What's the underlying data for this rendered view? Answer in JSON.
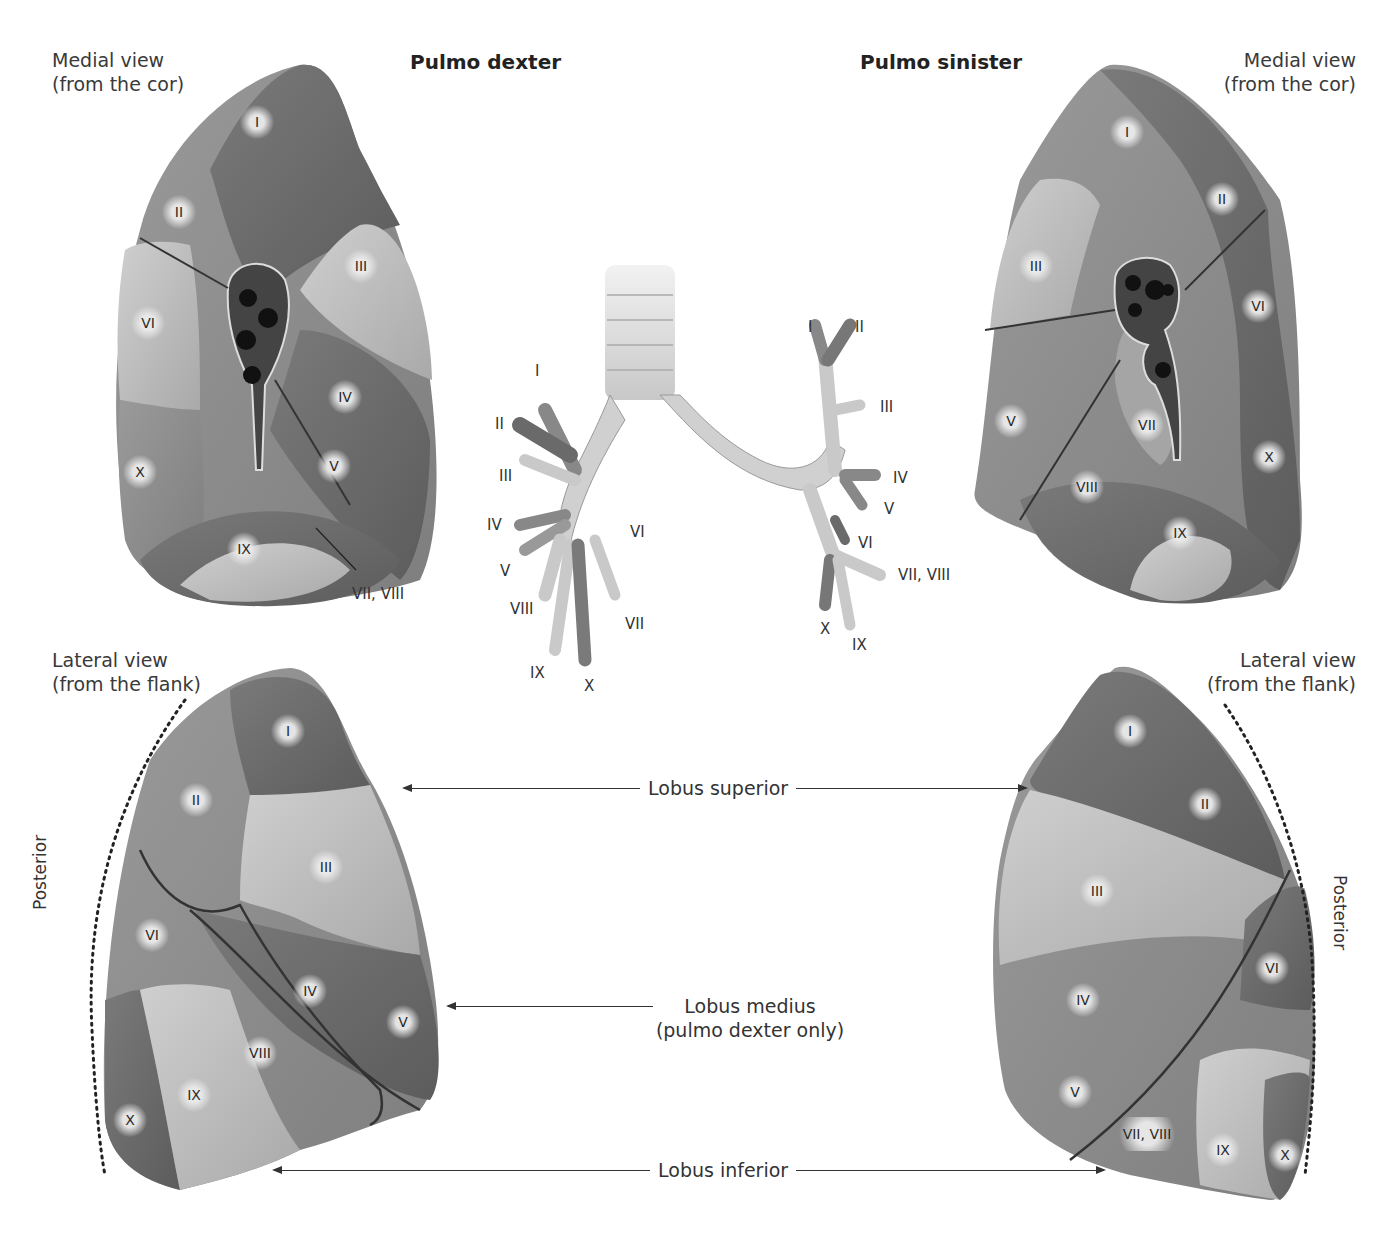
{
  "titles": {
    "right_lung": "Pulmo dexter",
    "left_lung": "Pulmo sinister"
  },
  "view_labels": {
    "medial_left": {
      "line1": "Medial view",
      "line2": "(from the cor)"
    },
    "medial_right": {
      "line1": "Medial view",
      "line2": "(from the cor)"
    },
    "lateral_left": {
      "line1": "Lateral view",
      "line2": "(from the flank)"
    },
    "lateral_right": {
      "line1": "Lateral view",
      "line2": "(from the flank)"
    }
  },
  "posterior_labels": {
    "left": "Posterior",
    "right": "Posterior"
  },
  "lobe_labels": {
    "superior": "Lobus superior",
    "medius_line1": "Lobus medius",
    "medius_line2": "(pulmo dexter only)",
    "inferior": "Lobus inferior"
  },
  "dexter_medial_segments": [
    "I",
    "II",
    "III",
    "IV",
    "V",
    "VI",
    "X",
    "IX"
  ],
  "dexter_medial_callout": "VII, VIII",
  "sinister_medial_segments": [
    "I",
    "II",
    "III",
    "V",
    "VI",
    "VII",
    "X",
    "VIII",
    "IX"
  ],
  "dexter_lateral_segments": [
    "I",
    "II",
    "III",
    "VI",
    "IV",
    "V",
    "VIII",
    "IX",
    "X"
  ],
  "sinister_lateral_segments": [
    "I",
    "II",
    "III",
    "VI",
    "IV",
    "V",
    "VII, VIII",
    "IX",
    "X"
  ],
  "bronchial_tree": {
    "right": [
      "I",
      "II",
      "III",
      "IV",
      "V",
      "VIII",
      "IX",
      "X",
      "VII",
      "VI"
    ],
    "left": [
      "I",
      "II",
      "III",
      "IV",
      "V",
      "VI",
      "VII, VIII",
      "X",
      "IX"
    ]
  },
  "colors": {
    "dark_segment": "#6e6e6e",
    "mid_segment": "#8c8c8c",
    "light_segment": "#bdbdbd",
    "text": "#333333"
  }
}
